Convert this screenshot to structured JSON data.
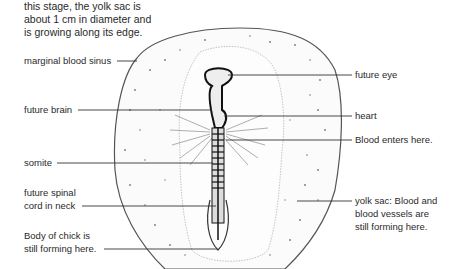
{
  "caption": {
    "line1": "this stage, the yolk sac is",
    "line2": "about 1 cm in diameter and",
    "line3": "is growing along its edge."
  },
  "labels_left": [
    {
      "id": "marginal-blood-sinus",
      "lines": [
        "marginal blood sinus"
      ]
    },
    {
      "id": "future-brain",
      "lines": [
        "future brain"
      ]
    },
    {
      "id": "somite",
      "lines": [
        "somite"
      ]
    },
    {
      "id": "future-spinal-cord",
      "lines": [
        "future spinal",
        "cord in neck"
      ]
    },
    {
      "id": "body-forming",
      "lines": [
        "Body of chick is",
        "still forming here."
      ]
    }
  ],
  "labels_right": [
    {
      "id": "future-eye",
      "lines": [
        "future eye"
      ]
    },
    {
      "id": "heart",
      "lines": [
        "heart"
      ]
    },
    {
      "id": "blood-enters",
      "lines": [
        "Blood enters here."
      ]
    },
    {
      "id": "yolk-sac",
      "lines": [
        "yolk sac: Blood and",
        "blood vessels are",
        "still forming here."
      ]
    }
  ],
  "colors": {
    "ink": "#2a2a2a",
    "outline": "#555555",
    "stipple": "#888888",
    "background": "#ffffff"
  }
}
